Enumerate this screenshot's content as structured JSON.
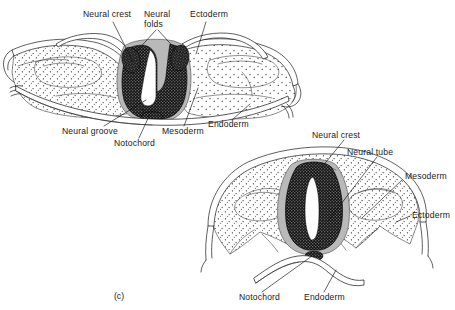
{
  "figure": {
    "caption": "(c)",
    "background_color": "#ffffff",
    "ink_color": "#1a1a1a",
    "panels": [
      {
        "id": "upper-embryo",
        "stage_name": "Neural groove stage",
        "labels": [
          {
            "key": "neural_crest",
            "text": "Neural crest",
            "x": 83,
            "y": 17,
            "anchor": "start"
          },
          {
            "key": "neural_folds",
            "text": "Neural",
            "text2": "folds",
            "x": 145,
            "y": 17,
            "anchor": "start"
          },
          {
            "key": "ectoderm",
            "text": "Ectoderm",
            "x": 190,
            "y": 17,
            "anchor": "start"
          },
          {
            "key": "neural_groove",
            "text": "Neural groove",
            "x": 64,
            "y": 131,
            "anchor": "start"
          },
          {
            "key": "notochord",
            "text": "Notochord",
            "x": 116,
            "y": 143,
            "anchor": "start"
          },
          {
            "key": "mesoderm",
            "text": "Mesoderm",
            "x": 163,
            "y": 131,
            "anchor": "start"
          },
          {
            "key": "endoderm",
            "text": "Endoderm",
            "x": 208,
            "y": 125,
            "anchor": "start"
          }
        ]
      },
      {
        "id": "lower-embryo",
        "stage_name": "Neural tube stage",
        "labels": [
          {
            "key": "neural_crest",
            "text": "Neural crest",
            "x": 312,
            "y": 135,
            "anchor": "start"
          },
          {
            "key": "neural_tube",
            "text": "Neural tube",
            "x": 347,
            "y": 152,
            "anchor": "start"
          },
          {
            "key": "mesoderm",
            "text": "Mesoderm",
            "x": 405,
            "y": 176,
            "anchor": "start"
          },
          {
            "key": "ectoderm",
            "text": "Ectoderm",
            "x": 412,
            "y": 214,
            "anchor": "start"
          },
          {
            "key": "notochord",
            "text": "Notochord",
            "x": 240,
            "y": 297,
            "anchor": "start"
          },
          {
            "key": "endoderm",
            "text": "Endoderm",
            "x": 305,
            "y": 297,
            "anchor": "start"
          }
        ]
      }
    ],
    "tissue_legend": [
      {
        "key": "ectoderm",
        "name": "Ectoderm",
        "render": "thin cellular band, outer surface"
      },
      {
        "key": "mesoderm",
        "name": "Mesoderm",
        "render": "stippled loose tissue"
      },
      {
        "key": "endoderm",
        "name": "Endoderm",
        "render": "wavy band with dark cuboidal cells"
      },
      {
        "key": "neural_crest",
        "name": "Neural crest",
        "render": "grey halo flanking neural tissue"
      },
      {
        "key": "neural_tube",
        "name": "Neural tube",
        "render": "dark dense epithelium with white lumen"
      },
      {
        "key": "notochord",
        "name": "Notochord",
        "render": "small rounded body beneath neural tissue"
      }
    ]
  }
}
